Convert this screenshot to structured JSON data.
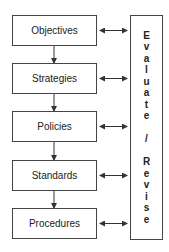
{
  "diagram": {
    "boxes": [
      {
        "label": "Objectives"
      },
      {
        "label": "Strategies"
      },
      {
        "label": "Policies"
      },
      {
        "label": "Standards"
      },
      {
        "label": "Procedures"
      }
    ],
    "side_box": {
      "label": "Evaluate / Revise",
      "letters": [
        "E",
        "v",
        "a",
        "l",
        "u",
        "a",
        "t",
        "e",
        "",
        "/",
        "",
        "R",
        "e",
        "v",
        "i",
        "s",
        "e"
      ]
    }
  }
}
